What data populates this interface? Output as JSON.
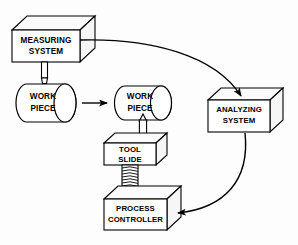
{
  "diagram": {
    "background_color": "#fdfdfd",
    "line_color": "#000000",
    "nodes": {
      "measuring_system": {
        "label_line1": "MEASURING",
        "label_line2": "SYSTEM",
        "shape": "cuboid"
      },
      "work_piece_left": {
        "label_line1": "WORK",
        "label_line2": "PIECE",
        "shape": "cylinder"
      },
      "work_piece_right": {
        "label_line1": "WORK",
        "label_line2": "PIECE",
        "shape": "cylinder"
      },
      "analyzing_system": {
        "label_line1": "ANALYZING",
        "label_line2": "SYSTEM",
        "shape": "cuboid"
      },
      "tool_slide": {
        "label_line1": "TOOL",
        "label_line2": "SLIDE",
        "shape": "cuboid"
      },
      "process_controller": {
        "label_line1": "PROCESS",
        "label_line2": "CONTROLLER",
        "shape": "cuboid"
      }
    },
    "connectors": [
      {
        "name": "measuring-probe",
        "from": "measuring_system",
        "to": "work_piece_left",
        "style": "probe-stylus",
        "arrow": false
      },
      {
        "name": "workpiece-transfer-arrow",
        "from": "work_piece_left",
        "to": "work_piece_right",
        "style": "straight",
        "arrow": true
      },
      {
        "name": "measuring-to-analyzing-curve",
        "from": "measuring_system",
        "to": "analyzing_system",
        "style": "curved",
        "arrow": true
      },
      {
        "name": "analyzing-to-controller-curve",
        "from": "analyzing_system",
        "to": "process_controller",
        "style": "curved",
        "arrow": true
      },
      {
        "name": "controller-to-slide-screw",
        "from": "process_controller",
        "to": "tool_slide",
        "style": "threaded-screw",
        "arrow": false
      },
      {
        "name": "slide-to-tool",
        "from": "tool_slide",
        "to": "work_piece_right",
        "style": "cutting-tool",
        "arrow": false
      }
    ]
  }
}
